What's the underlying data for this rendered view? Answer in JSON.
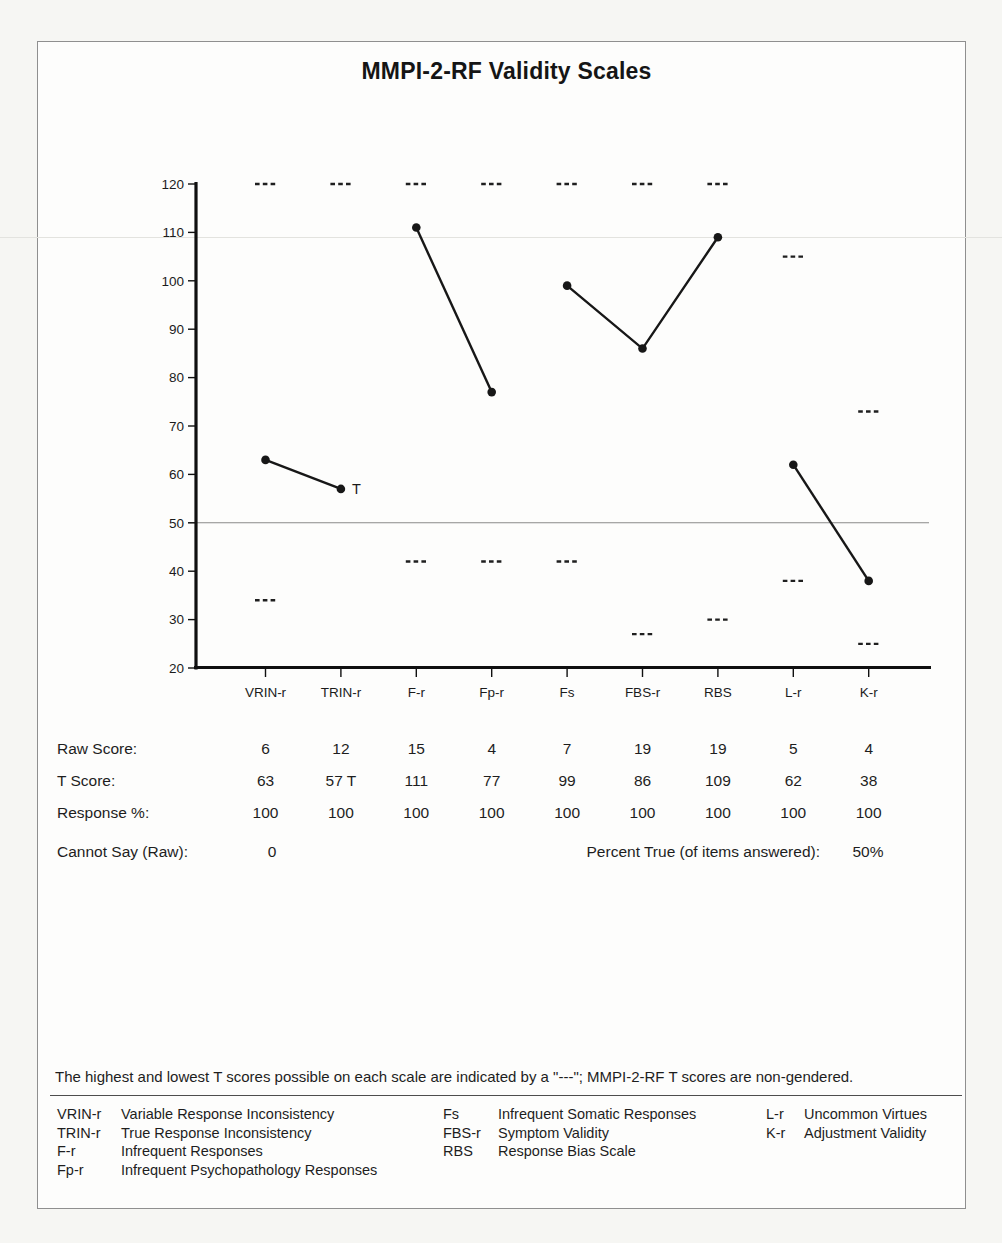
{
  "page": {
    "title": "MMPI-2-RF Validity Scales",
    "footnote": "The highest and lowest T scores possible on each scale are indicated by a \"---\"; MMPI-2-RF T scores are non-gendered."
  },
  "chart_data": {
    "type": "line",
    "title": "MMPI-2-RF Validity Scales",
    "categories": [
      "VRIN-r",
      "TRIN-r",
      "F-r",
      "Fp-r",
      "Fs",
      "FBS-r",
      "RBS",
      "L-r",
      "K-r"
    ],
    "series": [
      {
        "name": "T Score",
        "values": [
          63,
          57,
          111,
          77,
          99,
          86,
          109,
          62,
          38
        ]
      }
    ],
    "point_suffix": [
      "",
      "T",
      "",
      "",
      "",
      "",
      "",
      "",
      ""
    ],
    "connected_groups": [
      [
        0,
        1
      ],
      [
        2,
        3
      ],
      [
        4,
        5,
        6
      ],
      [
        7,
        8
      ]
    ],
    "max_possible_t": [
      120,
      120,
      120,
      120,
      120,
      120,
      120,
      105,
      73
    ],
    "min_possible_t": [
      34,
      null,
      42,
      42,
      42,
      27,
      30,
      38,
      25
    ],
    "ylim": [
      20,
      120
    ],
    "yticks": [
      120,
      110,
      100,
      90,
      80,
      70,
      60,
      50,
      40,
      30,
      20
    ],
    "reference_line_t": 50,
    "grid": false,
    "legend_position": "none",
    "marker": "filled-circle",
    "max_min_marker_glyph": "---"
  },
  "score_table": {
    "rows": [
      {
        "label": "Raw Score:",
        "values": [
          "6",
          "12",
          "15",
          "4",
          "7",
          "19",
          "19",
          "5",
          "4"
        ]
      },
      {
        "label": "T Score:",
        "values": [
          "63",
          "57 T",
          "111",
          "77",
          "99",
          "86",
          "109",
          "62",
          "38"
        ]
      },
      {
        "label": "Response %:",
        "values": [
          "100",
          "100",
          "100",
          "100",
          "100",
          "100",
          "100",
          "100",
          "100"
        ]
      }
    ],
    "cannot_say_label": "Cannot Say (Raw):",
    "cannot_say_value": "0",
    "percent_true_label": "Percent True (of items answered):",
    "percent_true_value": "50%"
  },
  "legend": {
    "columns": [
      {
        "items": [
          {
            "abbr": "VRIN-r",
            "name": "Variable Response Inconsistency"
          },
          {
            "abbr": "TRIN-r",
            "name": "True Response Inconsistency"
          },
          {
            "abbr": "F-r",
            "name": "Infrequent Responses"
          },
          {
            "abbr": "Fp-r",
            "name": "Infrequent Psychopathology Responses"
          }
        ]
      },
      {
        "items": [
          {
            "abbr": "Fs",
            "name": "Infrequent Somatic Responses"
          },
          {
            "abbr": "FBS-r",
            "name": "Symptom Validity"
          },
          {
            "abbr": "RBS",
            "name": "Response Bias Scale"
          }
        ]
      },
      {
        "items": [
          {
            "abbr": "L-r",
            "name": "Uncommon Virtues"
          },
          {
            "abbr": "K-r",
            "name": "Adjustment Validity"
          }
        ]
      }
    ]
  },
  "colors": {
    "ink": "#1b1b1b",
    "chart_line": "#171717",
    "axis": "#101010",
    "reference_line": "#8a8a8a",
    "marker_dash": "#1f1f1f",
    "page_border": "#8f8f8f",
    "artifact_line": "#e3e3df",
    "paper": "#fdfdfc"
  }
}
